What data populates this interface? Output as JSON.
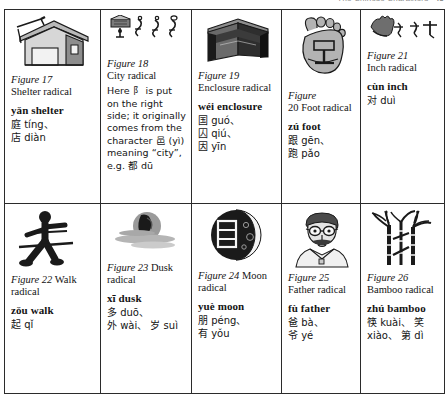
{
  "running_head": {
    "title": "The Chinese Characters",
    "page_number": "43"
  },
  "table": {
    "rows": [
      {
        "cells": [
          {
            "id": "figure-17",
            "icon": "house-shelter-illustration",
            "figure_number": "Figure 17",
            "figure_caption": "Shelter radical",
            "note": "",
            "pinyin_gloss": "yǎn shelter",
            "examples": [
              "庭 tíng、",
              "店 diàn"
            ]
          },
          {
            "id": "figure-18",
            "icon": "city-gate-seal-script-illustration",
            "figure_number": "Figure 18",
            "figure_caption": "City radical",
            "note": "Here 阝 is put on the right side; it originally comes from the character 邑 (yì) meaning “city”, e.g. 都 dū",
            "pinyin_gloss": "",
            "examples": []
          },
          {
            "id": "figure-19",
            "icon": "open-box-enclosure-illustration",
            "figure_number": "Figure 19",
            "figure_caption": "Enclosure radical",
            "note": "",
            "pinyin_gloss": "wéi enclosure",
            "examples": [
              "国 guó、",
              "囚 qiú、",
              "因 yīn"
            ]
          },
          {
            "id": "figure-20",
            "icon": "foot-sole-illustration",
            "figure_number": "Figure",
            "figure_caption": "20 Foot radical",
            "note": "",
            "pinyin_gloss": "zú foot",
            "examples": [
              "跟 gēn、",
              "跑 pǎo"
            ]
          },
          {
            "id": "figure-21",
            "icon": "hand-inch-measure-illustration",
            "figure_number": "Figure 21",
            "figure_caption": "Inch radical",
            "note": "",
            "pinyin_gloss": "cùn inch",
            "examples": [
              "对 duì"
            ]
          }
        ]
      },
      {
        "cells": [
          {
            "id": "figure-22",
            "icon": "walking-figure-illustration",
            "figure_number": "Figure 22",
            "figure_caption": "Walk radical",
            "note": "",
            "pinyin_gloss": "zǒu walk",
            "examples": [
              "起 qǐ"
            ]
          },
          {
            "id": "figure-23",
            "icon": "dusk-sunset-illustration",
            "figure_number": "Figure 23",
            "figure_caption": "Dusk radical",
            "note": "",
            "pinyin_gloss": "xī dusk",
            "examples": [
              "多 duō、",
              "外 wài、 岁 suì"
            ]
          },
          {
            "id": "figure-24",
            "icon": "crescent-moon-illustration",
            "figure_number": "Figure 24",
            "figure_caption": "Moon radical",
            "note": "",
            "pinyin_gloss": "yuè moon",
            "examples": [
              "朋 péng、",
              "有 yǒu"
            ]
          },
          {
            "id": "figure-25",
            "icon": "father-portrait-illustration",
            "figure_number": "Figure 25",
            "figure_caption": "Father radical",
            "note": "",
            "pinyin_gloss": "fù father",
            "examples": [
              "爸 bà、",
              "爷 yé"
            ]
          },
          {
            "id": "figure-26",
            "icon": "bamboo-stalks-illustration",
            "figure_number": "Figure 26",
            "figure_caption": "Bamboo radical",
            "note": "",
            "pinyin_gloss": "zhú bamboo",
            "examples": [
              "筷 kuài、 笑",
              "xiào、 第 dì"
            ]
          }
        ]
      }
    ]
  },
  "colors": {
    "border": "#2b2b2b",
    "text": "#141414",
    "art_dark": "#1a1a1a",
    "art_mid": "#8d8d8d",
    "art_light": "#c9c9c9",
    "background": "#ffffff"
  }
}
